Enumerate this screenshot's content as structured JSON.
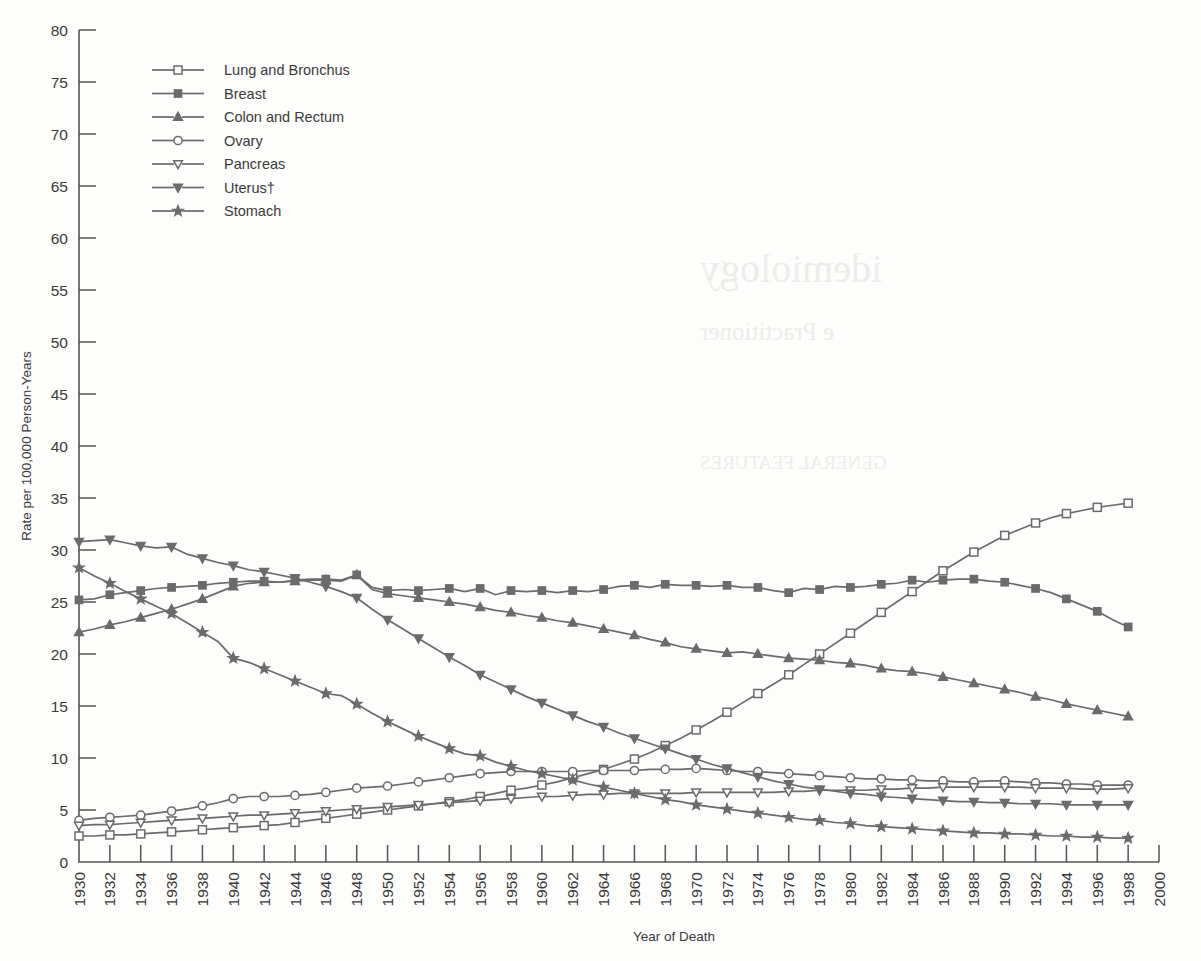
{
  "chart_data": {
    "type": "line",
    "title": "",
    "xlabel": "Year of Death",
    "ylabel": "Rate per 100,000 Person-Years",
    "xlim": [
      1930,
      2000
    ],
    "ylim": [
      0,
      80
    ],
    "ytick_step": 5,
    "xtick_step": 2,
    "grid": false,
    "legend_position": "top-left",
    "yticks": [
      0,
      5,
      10,
      15,
      20,
      25,
      30,
      35,
      40,
      45,
      50,
      55,
      60,
      65,
      70,
      75,
      80
    ],
    "xticks": [
      1930,
      1932,
      1934,
      1936,
      1938,
      1940,
      1942,
      1944,
      1946,
      1948,
      1950,
      1952,
      1954,
      1956,
      1958,
      1960,
      1962,
      1964,
      1966,
      1968,
      1970,
      1972,
      1974,
      1976,
      1978,
      1980,
      1982,
      1984,
      1986,
      1988,
      1990,
      1992,
      1994,
      1996,
      1998,
      2000
    ],
    "x": [
      1930,
      1931,
      1932,
      1933,
      1934,
      1935,
      1936,
      1937,
      1938,
      1939,
      1940,
      1941,
      1942,
      1943,
      1944,
      1945,
      1946,
      1947,
      1948,
      1949,
      1950,
      1951,
      1952,
      1953,
      1954,
      1955,
      1956,
      1957,
      1958,
      1959,
      1960,
      1961,
      1962,
      1963,
      1964,
      1965,
      1966,
      1967,
      1968,
      1969,
      1970,
      1971,
      1972,
      1973,
      1974,
      1975,
      1976,
      1977,
      1978,
      1979,
      1980,
      1981,
      1982,
      1983,
      1984,
      1985,
      1986,
      1987,
      1988,
      1989,
      1990,
      1991,
      1992,
      1993,
      1994,
      1995,
      1996,
      1997,
      1998
    ],
    "series": [
      {
        "name": "Lung and Bronchus",
        "marker": "open-square",
        "values": [
          2.5,
          2.5,
          2.6,
          2.6,
          2.7,
          2.8,
          2.9,
          3.0,
          3.1,
          3.2,
          3.3,
          3.4,
          3.5,
          3.6,
          3.8,
          4.0,
          4.2,
          4.4,
          4.6,
          4.8,
          5.0,
          5.2,
          5.4,
          5.6,
          5.8,
          6.0,
          6.3,
          6.6,
          6.9,
          7.1,
          7.4,
          7.7,
          8.1,
          8.5,
          8.9,
          9.4,
          9.9,
          10.5,
          11.2,
          11.9,
          12.7,
          13.5,
          14.4,
          15.3,
          16.2,
          17.1,
          18.0,
          19.0,
          20.0,
          21.0,
          22.0,
          23.0,
          24.0,
          25.0,
          26.0,
          27.0,
          28.0,
          28.9,
          29.8,
          30.6,
          31.4,
          32.0,
          32.6,
          33.1,
          33.5,
          33.8,
          34.1,
          34.3,
          34.5
        ]
      },
      {
        "name": "Breast",
        "marker": "filled-square",
        "values": [
          25.2,
          25.3,
          25.7,
          25.9,
          26.1,
          26.3,
          26.4,
          26.5,
          26.6,
          26.8,
          26.9,
          27.0,
          27.0,
          26.9,
          27.1,
          27.2,
          27.2,
          27.1,
          27.6,
          26.4,
          26.1,
          26.2,
          26.1,
          26.2,
          26.3,
          26.0,
          26.3,
          25.7,
          26.1,
          26.0,
          26.1,
          25.9,
          26.1,
          26.0,
          26.2,
          26.5,
          26.6,
          26.4,
          26.7,
          26.6,
          26.6,
          26.5,
          26.6,
          26.4,
          26.4,
          26.1,
          25.9,
          26.3,
          26.2,
          26.5,
          26.4,
          26.5,
          26.7,
          26.8,
          27.1,
          26.9,
          27.1,
          27.2,
          27.2,
          27.0,
          26.9,
          26.6,
          26.3,
          25.9,
          25.3,
          24.7,
          24.1,
          23.3,
          22.6
        ]
      },
      {
        "name": "Colon and Rectum",
        "marker": "filled-triangle-up",
        "values": [
          22.1,
          22.4,
          22.8,
          23.1,
          23.5,
          23.9,
          24.3,
          24.8,
          25.3,
          25.9,
          26.5,
          26.8,
          26.9,
          26.9,
          27.0,
          27.1,
          27.1,
          27.0,
          27.6,
          26.2,
          25.8,
          25.6,
          25.4,
          25.2,
          25.0,
          24.8,
          24.5,
          24.2,
          24.0,
          23.7,
          23.5,
          23.2,
          23.0,
          22.7,
          22.4,
          22.1,
          21.8,
          21.4,
          21.1,
          20.7,
          20.5,
          20.3,
          20.1,
          20.2,
          20.0,
          19.8,
          19.6,
          19.5,
          19.4,
          19.2,
          19.1,
          18.9,
          18.6,
          18.4,
          18.3,
          18.1,
          17.8,
          17.5,
          17.2,
          16.9,
          16.6,
          16.3,
          15.9,
          15.6,
          15.2,
          14.9,
          14.6,
          14.3,
          14.0
        ]
      },
      {
        "name": "Ovary",
        "marker": "open-circle",
        "values": [
          4.0,
          4.2,
          4.3,
          4.4,
          4.5,
          4.7,
          4.9,
          5.1,
          5.4,
          5.7,
          6.1,
          6.3,
          6.3,
          6.3,
          6.4,
          6.5,
          6.7,
          6.9,
          7.1,
          7.2,
          7.3,
          7.5,
          7.7,
          7.9,
          8.1,
          8.3,
          8.5,
          8.6,
          8.7,
          8.7,
          8.7,
          8.7,
          8.7,
          8.8,
          8.8,
          8.8,
          8.8,
          8.9,
          8.9,
          8.9,
          9.0,
          8.9,
          8.8,
          8.7,
          8.7,
          8.6,
          8.5,
          8.4,
          8.3,
          8.2,
          8.1,
          8.0,
          8.0,
          7.9,
          7.9,
          7.8,
          7.8,
          7.7,
          7.7,
          7.8,
          7.8,
          7.7,
          7.6,
          7.6,
          7.5,
          7.5,
          7.4,
          7.4,
          7.4
        ]
      },
      {
        "name": "Pancreas",
        "marker": "open-triangle-down",
        "values": [
          3.5,
          3.6,
          3.6,
          3.7,
          3.8,
          3.9,
          4.0,
          4.1,
          4.2,
          4.3,
          4.4,
          4.5,
          4.5,
          4.6,
          4.7,
          4.8,
          4.9,
          5.0,
          5.1,
          5.2,
          5.3,
          5.4,
          5.5,
          5.6,
          5.7,
          5.8,
          5.9,
          6.0,
          6.1,
          6.2,
          6.3,
          6.3,
          6.4,
          6.5,
          6.5,
          6.6,
          6.6,
          6.6,
          6.6,
          6.6,
          6.7,
          6.7,
          6.7,
          6.7,
          6.7,
          6.7,
          6.8,
          6.8,
          6.9,
          6.9,
          6.9,
          6.9,
          7.0,
          7.0,
          7.1,
          7.1,
          7.2,
          7.2,
          7.2,
          7.2,
          7.2,
          7.2,
          7.1,
          7.1,
          7.1,
          7.0,
          7.0,
          7.0,
          7.1
        ]
      },
      {
        "name": "Uterus†",
        "marker": "filled-triangle-down",
        "values": [
          30.8,
          30.9,
          31.0,
          30.7,
          30.4,
          30.2,
          30.3,
          29.6,
          29.2,
          28.8,
          28.5,
          28.1,
          27.9,
          27.6,
          27.3,
          26.9,
          26.5,
          26.0,
          25.4,
          24.3,
          23.3,
          22.4,
          21.5,
          20.6,
          19.7,
          18.9,
          18.0,
          17.3,
          16.6,
          15.9,
          15.3,
          14.7,
          14.1,
          13.5,
          13.0,
          12.4,
          11.9,
          11.4,
          10.9,
          10.4,
          9.9,
          9.4,
          9.0,
          8.6,
          8.2,
          7.8,
          7.5,
          7.2,
          7.0,
          6.8,
          6.6,
          6.5,
          6.3,
          6.2,
          6.1,
          6.0,
          5.9,
          5.8,
          5.8,
          5.7,
          5.7,
          5.6,
          5.6,
          5.6,
          5.5,
          5.5,
          5.5,
          5.5,
          5.5
        ]
      },
      {
        "name": "Stomach",
        "marker": "filled-star",
        "values": [
          28.3,
          27.5,
          26.8,
          26.0,
          25.3,
          24.6,
          23.9,
          23.0,
          22.1,
          21.2,
          19.6,
          19.2,
          18.6,
          18.0,
          17.4,
          16.8,
          16.2,
          16.0,
          15.2,
          14.3,
          13.5,
          12.8,
          12.1,
          11.5,
          10.9,
          10.4,
          10.2,
          9.6,
          9.2,
          8.8,
          8.5,
          8.2,
          7.9,
          7.5,
          7.2,
          6.9,
          6.6,
          6.3,
          6.0,
          5.8,
          5.5,
          5.3,
          5.1,
          4.9,
          4.7,
          4.5,
          4.3,
          4.1,
          4.0,
          3.8,
          3.7,
          3.5,
          3.4,
          3.3,
          3.2,
          3.1,
          3.0,
          2.9,
          2.8,
          2.8,
          2.7,
          2.7,
          2.6,
          2.5,
          2.5,
          2.4,
          2.4,
          2.3,
          2.3
        ]
      }
    ]
  },
  "legend": {
    "items": [
      {
        "label": "Lung and Bronchus",
        "marker": "open-square"
      },
      {
        "label": "Breast",
        "marker": "filled-square"
      },
      {
        "label": "Colon and Rectum",
        "marker": "filled-triangle-up"
      },
      {
        "label": "Ovary",
        "marker": "open-circle"
      },
      {
        "label": "Pancreas",
        "marker": "open-triangle-down"
      },
      {
        "label": "Uterus†",
        "marker": "filled-triangle-down"
      },
      {
        "label": "Stomach",
        "marker": "filled-star"
      }
    ]
  },
  "colors": {
    "line": "#6b6b6b",
    "axis": "#555555",
    "text": "#3a3a3a",
    "background": "#fdfdfb"
  },
  "background_bleed": [
    {
      "text": "idemiology",
      "x": 700,
      "y": 245,
      "size": 40
    },
    {
      "text": "e Practitioner",
      "x": 700,
      "y": 318,
      "size": 25
    },
    {
      "text": "GENERAL FEATURES",
      "x": 700,
      "y": 452,
      "size": 19
    }
  ]
}
